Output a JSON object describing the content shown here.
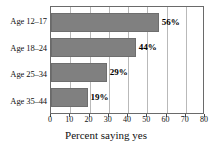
{
  "chart_data": {
    "type": "bar",
    "orientation": "horizontal",
    "title": "",
    "xlabel": "Percent saying yes",
    "ylabel": "",
    "categories": [
      "Age 12–17",
      "Age 18–24",
      "Age 25–34",
      "Age 35–44"
    ],
    "values": [
      56,
      44,
      29,
      19
    ],
    "data_labels": [
      "56%",
      "44%",
      "29%",
      "19%"
    ],
    "xlim": [
      0,
      80
    ],
    "xticks": [
      0,
      10,
      20,
      30,
      40,
      50,
      60,
      70,
      80
    ],
    "xtick_labels": [
      "0",
      "10",
      "20",
      "30",
      "40",
      "50",
      "60",
      "70",
      "80"
    ],
    "grid": true,
    "grid_axis": "x",
    "legend": false,
    "bar_color": "#808080",
    "bar_edge_color": "#6e6e6e",
    "grid_color": "#b9b9b9",
    "frame_color": "#6a6a6a"
  }
}
